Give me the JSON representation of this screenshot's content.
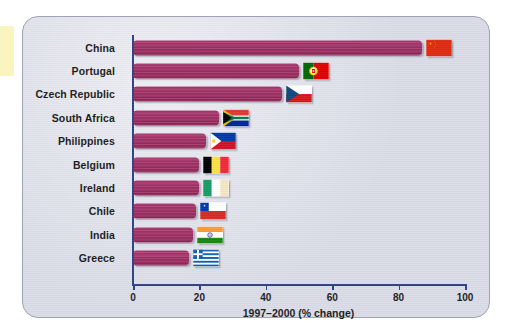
{
  "chart_data": {
    "type": "bar",
    "orientation": "horizontal",
    "title": "",
    "xlabel": "1997–2000 (% change)",
    "ylabel": "",
    "xlim": [
      0,
      100
    ],
    "xticks": [
      0,
      20,
      40,
      60,
      80,
      100
    ],
    "grid": false,
    "legend": "none",
    "bar_color": "#a43168",
    "axis_color": "#2d3f87",
    "panel_color": "#d9dbe6",
    "categories": [
      "China",
      "Portugal",
      "Czech Republic",
      "South Africa",
      "Philippines",
      "Belgium",
      "Ireland",
      "Chile",
      "India",
      "Greece"
    ],
    "values": [
      87,
      50,
      45,
      26,
      22,
      20,
      20,
      19,
      18,
      17
    ],
    "icons": [
      "flag-china-icon",
      "flag-portugal-icon",
      "flag-czech-republic-icon",
      "flag-south-africa-icon",
      "flag-philippines-icon",
      "flag-belgium-icon",
      "flag-ireland-icon",
      "flag-chile-icon",
      "flag-india-icon",
      "flag-greece-icon"
    ]
  }
}
